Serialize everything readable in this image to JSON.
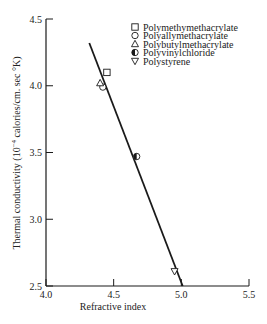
{
  "chart_data": {
    "type": "scatter",
    "title": "",
    "xlabel": "Refractive index",
    "ylabel": "Thermal conductivity (10⁻⁴ calories/cm. sec °K)",
    "ylabel_parts": {
      "pre": "Thermal conductivity (10",
      "exp": "−4",
      "post": " calories/cm. sec °K)"
    },
    "xlim": [
      4.0,
      5.5
    ],
    "ylim": [
      2.5,
      4.5
    ],
    "xticks": [
      "4.0",
      "4.5",
      "5.0",
      "5.5"
    ],
    "yticks": [
      "2.5",
      "3.0",
      "3.5",
      "4.0",
      "4.5"
    ],
    "grid": false,
    "legend_position": "upper right",
    "series": [
      {
        "name": "Polymethymethacrylate",
        "marker": "square-open",
        "x": 4.45,
        "y": 4.1
      },
      {
        "name": "Polyallymethacrylate",
        "marker": "circle-open",
        "x": 4.42,
        "y": 3.99
      },
      {
        "name": "Polybutylmethacrylate",
        "marker": "triangle-up-open",
        "x": 4.4,
        "y": 4.02
      },
      {
        "name": "Polyvinylchloride",
        "marker": "circle-half-filled",
        "x": 4.67,
        "y": 3.47
      },
      {
        "name": "Polystyrene",
        "marker": "triangle-down-open",
        "x": 4.95,
        "y": 2.61
      }
    ],
    "fit_line": {
      "x": [
        4.32,
        5.01
      ],
      "y": [
        4.32,
        2.5
      ]
    }
  },
  "colors": {
    "ink": "#1a1a1a",
    "background": "#ffffff"
  }
}
